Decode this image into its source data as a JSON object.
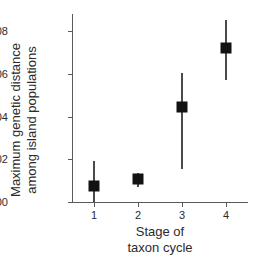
{
  "chart_data": {
    "type": "scatter",
    "title": "",
    "subtitle": "",
    "xlabel_line1": "Stage of",
    "xlabel_line2": "taxon cycle",
    "ylabel_line1": "Maximum genetic distance",
    "ylabel_line2": "among island populations",
    "grid": false,
    "legend": "none",
    "xlim": [
      0.5,
      4.5
    ],
    "ylim": [
      0.0,
      0.088
    ],
    "x_tick_labels": [
      "1",
      "2",
      "3",
      "4"
    ],
    "x": [
      1,
      2,
      3,
      4
    ],
    "y_tick_labels": [
      "0.00",
      "0.02",
      "0.04",
      "0.06",
      "0.08"
    ],
    "y_ticks": [
      0.0,
      0.02,
      0.04,
      0.06,
      0.08
    ],
    "categories": [
      "1",
      "2",
      "3",
      "4"
    ],
    "values": [
      0.0073,
      0.011,
      0.0445,
      0.072
    ],
    "error_low": [
      0.0002,
      0.007,
      0.0155,
      0.057
    ],
    "error_high": [
      0.019,
      0.0138,
      0.0605,
      0.085
    ],
    "series": [
      {
        "name": "Maximum genetic distance",
        "marker": "filled-square",
        "color": "#121212",
        "errorbar_color": "#4a4a4c",
        "points": [
          {
            "x": 1,
            "y": 0.0073,
            "lo": 0.0002,
            "hi": 0.019
          },
          {
            "x": 2,
            "y": 0.011,
            "lo": 0.007,
            "hi": 0.0138
          },
          {
            "x": 3,
            "y": 0.0445,
            "lo": 0.0155,
            "hi": 0.0605
          },
          {
            "x": 4,
            "y": 0.072,
            "lo": 0.057,
            "hi": 0.085
          }
        ]
      }
    ],
    "axis_color": "#59595b"
  }
}
